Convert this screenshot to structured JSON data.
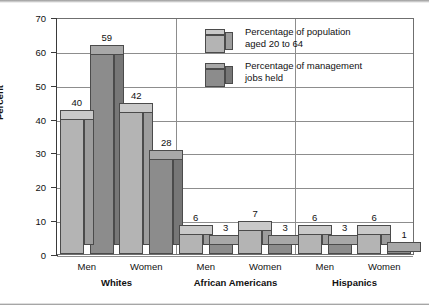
{
  "chart_data": {
    "type": "bar",
    "title": "",
    "xlabel": "",
    "ylabel": "Percent",
    "ylim": [
      0,
      70
    ],
    "ytick_step": 10,
    "yticks": [
      "0",
      "10",
      "20",
      "30",
      "40",
      "50",
      "60",
      "70"
    ],
    "grid": true,
    "legend_position": "top-right-inside",
    "groups": [
      {
        "name": "Whites",
        "categories": [
          "Men",
          "Women"
        ],
        "values": {
          "Percentage of population aged 20 to 64": [
            40,
            42
          ],
          "Percentage of management jobs held": [
            59,
            28
          ]
        }
      },
      {
        "name": "African Americans",
        "categories": [
          "Men",
          "Women"
        ],
        "values": {
          "Percentage of population aged 20 to 64": [
            6,
            7
          ],
          "Percentage of management jobs held": [
            3,
            3
          ]
        }
      },
      {
        "name": "Hispanics",
        "categories": [
          "Men",
          "Women"
        ],
        "values": {
          "Percentage of population aged 20 to 64": [
            6,
            6
          ],
          "Percentage of management jobs held": [
            3,
            1
          ]
        }
      }
    ],
    "series": [
      {
        "name": "Percentage of population aged 20 to 64",
        "color": "#b4b4b4",
        "categories": [
          "Whites Men",
          "Whites Women",
          "African Americans Men",
          "African Americans Women",
          "Hispanics Men",
          "Hispanics Women"
        ],
        "values": [
          40,
          42,
          6,
          7,
          6,
          6
        ]
      },
      {
        "name": "Percentage of management jobs held",
        "color": "#8c8c8c",
        "categories": [
          "Whites Men",
          "Whites Women",
          "African Americans Men",
          "African Americans Women",
          "Hispanics Men",
          "Hispanics Women"
        ],
        "values": [
          59,
          28,
          3,
          3,
          3,
          1
        ]
      }
    ]
  },
  "axis": {
    "y_title": "Percent",
    "y_ticks": [
      "70",
      "60",
      "50",
      "40",
      "30",
      "20",
      "10",
      "0"
    ]
  },
  "legend": {
    "items": [
      {
        "label_line1": "Percentage of population",
        "label_line2": "aged 20 to 64",
        "color": "#b4b4b4"
      },
      {
        "label_line1": "Percentage of management",
        "label_line2": "jobs held",
        "color": "#8c8c8c"
      }
    ]
  },
  "categories": [
    {
      "label": "Men"
    },
    {
      "label": "Women"
    },
    {
      "label": "Men"
    },
    {
      "label": "Women"
    },
    {
      "label": "Men"
    },
    {
      "label": "Women"
    }
  ],
  "group_labels": [
    {
      "label": "Whites"
    },
    {
      "label": "African Americans"
    },
    {
      "label": "Hispanics"
    }
  ],
  "bar_labels": [
    {
      "v": "40"
    },
    {
      "v": "59"
    },
    {
      "v": "42"
    },
    {
      "v": "28"
    },
    {
      "v": "6"
    },
    {
      "v": "3"
    },
    {
      "v": "7"
    },
    {
      "v": "3"
    },
    {
      "v": "6"
    },
    {
      "v": "3"
    },
    {
      "v": "6"
    },
    {
      "v": "1"
    }
  ],
  "colors": {
    "series1": "#b4b4b4",
    "series1_top": "#c9c9c9",
    "series1_side": "#9d9d9d",
    "series2": "#8c8c8c",
    "series2_top": "#a8a8a8",
    "series2_side": "#777777",
    "grid": "#8d8d8d",
    "frame": "#6f6f6f",
    "axis": "#3a3a3a",
    "text": "#111111"
  }
}
